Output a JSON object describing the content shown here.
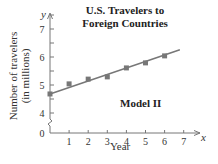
{
  "chart_data": {
    "type": "scatter",
    "title": "U.S. Travelers to Foreign Countries",
    "title_lines": [
      "U.S. Travelers to",
      "Foreign Countries"
    ],
    "xlabel": "Year",
    "ylabel": "Number of travelers (in millions)",
    "ylabel_lines": [
      "Number of travelers",
      "(in millions)"
    ],
    "x_axis_symbol": "x",
    "y_axis_symbol": "y",
    "annotation": "Model II",
    "x": [
      0,
      1,
      2,
      3,
      4,
      5,
      6
    ],
    "series": [
      {
        "name": "Data",
        "values": [
          4.68,
          5.04,
          5.21,
          5.29,
          5.61,
          5.79,
          6.04
        ]
      },
      {
        "name": "Model II (linear fit)",
        "line": {
          "x_start": 0,
          "y_start": 4.68,
          "x_end": 6.8,
          "y_end": 6.26
        }
      }
    ],
    "xticks": [
      1,
      2,
      3,
      4,
      5,
      6,
      7
    ],
    "yticks": [
      4,
      5,
      6,
      7
    ],
    "y_origin_label": "0",
    "xlim": [
      0,
      7.5
    ],
    "ylim": [
      4,
      7.5
    ],
    "y_axis_break": true,
    "grid": false,
    "colors": {
      "axis": "#777777",
      "points": "#777777",
      "line": "#777777",
      "text": "#333333"
    }
  }
}
